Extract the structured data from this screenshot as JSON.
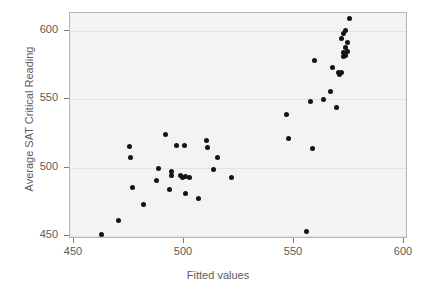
{
  "chart_data": {
    "type": "scatter",
    "title": "",
    "xlabel": "Fitted values",
    "ylabel": "Average SAT Critical Reading",
    "xlim": [
      450,
      600
    ],
    "ylim": [
      445,
      612
    ],
    "xticks": [
      450,
      500,
      550,
      600
    ],
    "yticks": [
      450,
      500,
      550,
      600
    ],
    "xtick_labels": [
      "450",
      "500",
      "550",
      "600"
    ],
    "ytick_labels": [
      "450",
      "500",
      "550",
      "600"
    ],
    "grid": "horizontal",
    "legend": "none",
    "marker": "filled-circle",
    "marker_color": "#141414",
    "panel_background": "#f3f3f3",
    "points": [
      {
        "x": 462.3,
        "y": 450.9
      },
      {
        "x": 470.0,
        "y": 461.4
      },
      {
        "x": 475.0,
        "y": 515.3
      },
      {
        "x": 475.5,
        "y": 507.5
      },
      {
        "x": 476.4,
        "y": 485.4
      },
      {
        "x": 481.8,
        "y": 473.2
      },
      {
        "x": 487.7,
        "y": 490.6
      },
      {
        "x": 488.2,
        "y": 499.2
      },
      {
        "x": 491.8,
        "y": 524.0
      },
      {
        "x": 493.6,
        "y": 484.3
      },
      {
        "x": 494.5,
        "y": 497.2
      },
      {
        "x": 494.5,
        "y": 494.0
      },
      {
        "x": 496.4,
        "y": 516.0
      },
      {
        "x": 498.6,
        "y": 494.5
      },
      {
        "x": 499.5,
        "y": 493.1
      },
      {
        "x": 500.0,
        "y": 516.0
      },
      {
        "x": 500.5,
        "y": 493.5
      },
      {
        "x": 500.9,
        "y": 481.3
      },
      {
        "x": 502.7,
        "y": 493.1
      },
      {
        "x": 506.4,
        "y": 477.4
      },
      {
        "x": 510.0,
        "y": 520.0
      },
      {
        "x": 510.9,
        "y": 514.6
      },
      {
        "x": 513.6,
        "y": 498.5
      },
      {
        "x": 515.0,
        "y": 507.5
      },
      {
        "x": 521.8,
        "y": 492.7
      },
      {
        "x": 546.8,
        "y": 539.2
      },
      {
        "x": 547.3,
        "y": 521.0
      },
      {
        "x": 555.5,
        "y": 453.5
      },
      {
        "x": 557.7,
        "y": 548.2
      },
      {
        "x": 558.2,
        "y": 514.0
      },
      {
        "x": 559.1,
        "y": 578.5
      },
      {
        "x": 563.6,
        "y": 550.0
      },
      {
        "x": 566.4,
        "y": 555.8
      },
      {
        "x": 567.3,
        "y": 573.5
      },
      {
        "x": 569.1,
        "y": 544.2
      },
      {
        "x": 570.0,
        "y": 570.0
      },
      {
        "x": 570.5,
        "y": 568.0
      },
      {
        "x": 571.4,
        "y": 569.5
      },
      {
        "x": 571.8,
        "y": 594.5
      },
      {
        "x": 572.3,
        "y": 584.0
      },
      {
        "x": 572.3,
        "y": 581.5
      },
      {
        "x": 572.7,
        "y": 598.0
      },
      {
        "x": 573.2,
        "y": 588.0
      },
      {
        "x": 573.6,
        "y": 582.0
      },
      {
        "x": 573.6,
        "y": 600.5
      },
      {
        "x": 574.1,
        "y": 591.5
      },
      {
        "x": 574.5,
        "y": 585.0
      },
      {
        "x": 575.0,
        "y": 609.0
      }
    ]
  }
}
